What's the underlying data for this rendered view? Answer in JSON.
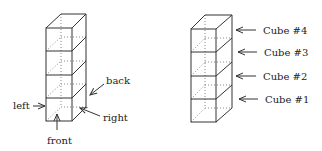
{
  "left_diagram": {
    "labels": {
      "back": "back",
      "left": "left",
      "right": "right",
      "front": "front"
    }
  },
  "right_diagram": {
    "labels": [
      "Cube #4",
      "Cube #3",
      "Cube #2",
      "Cube #1"
    ]
  },
  "colors": {
    "line": "#333333",
    "hidden": "#888888"
  }
}
